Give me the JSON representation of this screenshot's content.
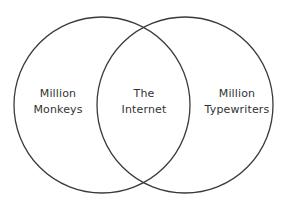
{
  "diagram": {
    "type": "venn",
    "background_color": "#ffffff",
    "stroke_color": "#3a3a3a",
    "stroke_width": 1.3,
    "text_color": "#333333",
    "canvas": {
      "width": 291,
      "height": 205
    },
    "circles": [
      {
        "id": "left",
        "cx": 102,
        "cy": 105,
        "r": 88,
        "fill": "none",
        "stroke": "#3a3a3a"
      },
      {
        "id": "right",
        "cx": 185,
        "cy": 105,
        "r": 88,
        "fill": "none",
        "stroke": "#3a3a3a"
      }
    ],
    "labels": {
      "left": {
        "region": "left-only",
        "line1": "Million",
        "line2": "Monkeys"
      },
      "center": {
        "region": "intersection",
        "line1": "The",
        "line2": "Internet"
      },
      "right": {
        "region": "right-only",
        "line1": "Million",
        "line2": "Typewriters"
      }
    }
  }
}
